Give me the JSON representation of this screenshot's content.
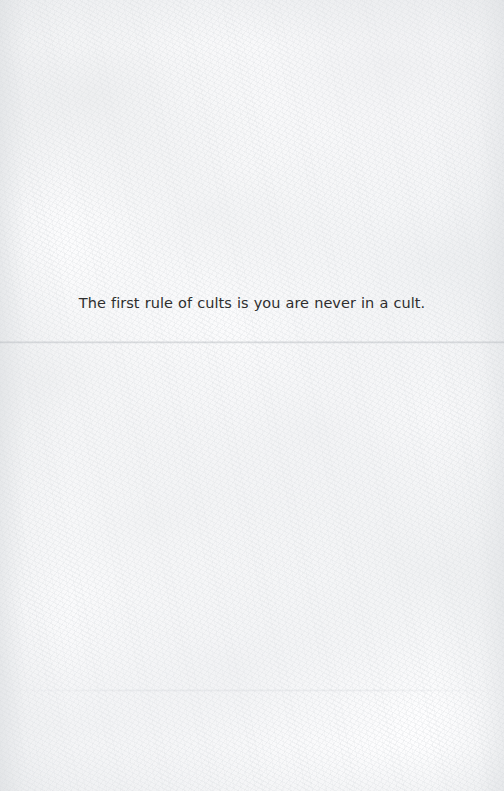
{
  "page": {
    "kind": "scanned-paper-page",
    "width": 504,
    "height": 791,
    "paper_color": "#fdfdfe",
    "ink_color": "#2e2e2e"
  },
  "content": {
    "quote": "The first rule of cults is you are never in a cult."
  },
  "marks": {
    "primary_crease_label": "horizontal fold crease",
    "secondary_crease_label": "faint lower fold crease"
  }
}
